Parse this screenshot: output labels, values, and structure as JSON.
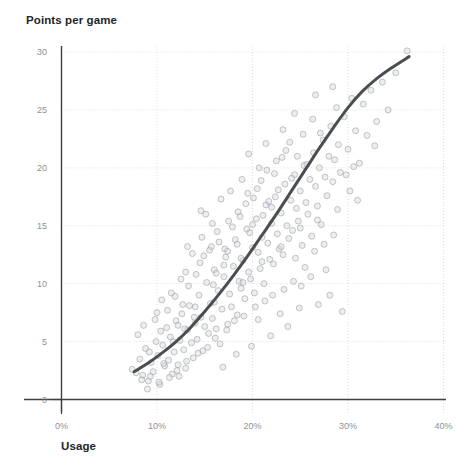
{
  "chart_data": {
    "type": "scatter",
    "title": "Points per game",
    "xlabel": "Usage",
    "ylabel": "",
    "grid": true,
    "grid_style": "dotted",
    "legend": "none",
    "xlim": [
      0,
      40
    ],
    "ylim": [
      0,
      30
    ],
    "x_tick_labels": [
      "0%",
      "10%",
      "20%",
      "30%",
      "40%"
    ],
    "x_ticks": [
      0,
      10,
      20,
      30,
      40
    ],
    "y_tick_labels": [
      "0",
      "5",
      "10",
      "15",
      "20",
      "25",
      "30"
    ],
    "y_ticks": [
      0,
      5,
      10,
      15,
      20,
      25,
      30
    ],
    "x_unit": "%",
    "marker": {
      "shape": "circle",
      "size_px": 6,
      "stroke_color": "#8a8f95",
      "fill_color": "#d8dade",
      "opacity": 0.55
    },
    "trend_line": {
      "name": "fitted curve",
      "color": "#4a4d52",
      "width_px": 3,
      "points": [
        [
          7.6,
          2.4
        ],
        [
          9.0,
          3.1
        ],
        [
          10.5,
          4.0
        ],
        [
          12.0,
          5.0
        ],
        [
          13.5,
          6.2
        ],
        [
          15.0,
          7.6
        ],
        [
          16.5,
          9.1
        ],
        [
          18.0,
          10.7
        ],
        [
          19.5,
          12.4
        ],
        [
          21.0,
          14.2
        ],
        [
          22.5,
          16.0
        ],
        [
          24.0,
          17.9
        ],
        [
          25.5,
          19.8
        ],
        [
          27.0,
          21.7
        ],
        [
          28.5,
          23.5
        ],
        [
          30.0,
          25.2
        ],
        [
          31.5,
          26.6
        ],
        [
          33.0,
          27.7
        ],
        [
          34.5,
          28.6
        ],
        [
          36.4,
          29.6
        ]
      ]
    },
    "points": [
      [
        7.4,
        2.6
      ],
      [
        7.8,
        2.3
      ],
      [
        8.2,
        3.5
      ],
      [
        8.5,
        2.1
      ],
      [
        8.8,
        4.4
      ],
      [
        9.1,
        1.6
      ],
      [
        9.4,
        3.2
      ],
      [
        9.6,
        2.4
      ],
      [
        9.9,
        5.0
      ],
      [
        10.1,
        3.8
      ],
      [
        10.3,
        1.3
      ],
      [
        10.6,
        4.7
      ],
      [
        10.8,
        2.9
      ],
      [
        11.0,
        6.2
      ],
      [
        11.2,
        3.4
      ],
      [
        11.4,
        5.4
      ],
      [
        11.6,
        2.2
      ],
      [
        11.8,
        4.1
      ],
      [
        12.0,
        6.8
      ],
      [
        12.2,
        3.0
      ],
      [
        12.4,
        5.1
      ],
      [
        12.6,
        7.4
      ],
      [
        12.8,
        4.3
      ],
      [
        13.0,
        2.7
      ],
      [
        13.2,
        6.0
      ],
      [
        13.4,
        8.1
      ],
      [
        13.6,
        4.9
      ],
      [
        13.8,
        3.6
      ],
      [
        14.0,
        6.6
      ],
      [
        14.2,
        5.2
      ],
      [
        14.4,
        9.0
      ],
      [
        14.6,
        7.1
      ],
      [
        14.8,
        4.2
      ],
      [
        15.0,
        6.3
      ],
      [
        15.2,
        10.1
      ],
      [
        15.4,
        5.7
      ],
      [
        15.6,
        8.3
      ],
      [
        15.8,
        7.0
      ],
      [
        16.0,
        11.2
      ],
      [
        16.2,
        6.1
      ],
      [
        16.4,
        9.4
      ],
      [
        16.6,
        4.8
      ],
      [
        16.8,
        7.8
      ],
      [
        17.0,
        10.6
      ],
      [
        17.2,
        12.3
      ],
      [
        17.4,
        6.5
      ],
      [
        17.6,
        9.1
      ],
      [
        17.8,
        8.0
      ],
      [
        18.0,
        11.5
      ],
      [
        18.2,
        13.8
      ],
      [
        18.4,
        7.3
      ],
      [
        18.6,
        10.2
      ],
      [
        18.8,
        9.6
      ],
      [
        19.0,
        12.0
      ],
      [
        19.2,
        8.7
      ],
      [
        19.4,
        14.7
      ],
      [
        19.6,
        11.0
      ],
      [
        19.8,
        10.4
      ],
      [
        20.0,
        13.1
      ],
      [
        20.2,
        9.2
      ],
      [
        20.4,
        15.6
      ],
      [
        20.6,
        12.7
      ],
      [
        20.8,
        11.3
      ],
      [
        21.0,
        14.0
      ],
      [
        21.2,
        10.0
      ],
      [
        21.4,
        16.8
      ],
      [
        21.6,
        13.5
      ],
      [
        21.8,
        12.1
      ],
      [
        22.0,
        15.2
      ],
      [
        22.2,
        11.7
      ],
      [
        22.4,
        17.5
      ],
      [
        22.6,
        14.3
      ],
      [
        22.8,
        13.0
      ],
      [
        23.0,
        16.1
      ],
      [
        23.2,
        12.5
      ],
      [
        23.4,
        18.6
      ],
      [
        23.6,
        15.0
      ],
      [
        23.8,
        13.9
      ],
      [
        24.0,
        17.2
      ],
      [
        24.2,
        14.6
      ],
      [
        24.4,
        19.4
      ],
      [
        24.6,
        16.5
      ],
      [
        24.8,
        15.4
      ],
      [
        25.0,
        18.0
      ],
      [
        25.2,
        13.3
      ],
      [
        25.4,
        20.2
      ],
      [
        25.6,
        17.0
      ],
      [
        25.8,
        16.0
      ],
      [
        26.0,
        19.0
      ],
      [
        26.2,
        14.1
      ],
      [
        26.4,
        21.3
      ],
      [
        26.6,
        18.4
      ],
      [
        26.8,
        16.7
      ],
      [
        27.0,
        20.0
      ],
      [
        27.2,
        15.1
      ],
      [
        27.4,
        22.4
      ],
      [
        27.6,
        19.2
      ],
      [
        27.8,
        17.6
      ],
      [
        28.0,
        21.0
      ],
      [
        28.2,
        23.6
      ],
      [
        28.4,
        18.8
      ],
      [
        28.6,
        20.7
      ],
      [
        28.8,
        25.2
      ],
      [
        29.0,
        22.0
      ],
      [
        29.2,
        19.6
      ],
      [
        29.6,
        24.4
      ],
      [
        30.0,
        21.6
      ],
      [
        30.4,
        26.0
      ],
      [
        30.8,
        23.2
      ],
      [
        31.2,
        20.4
      ],
      [
        31.6,
        25.5
      ],
      [
        32.0,
        22.8
      ],
      [
        32.4,
        26.7
      ],
      [
        33.0,
        24.0
      ],
      [
        33.6,
        27.4
      ],
      [
        34.2,
        25.0
      ],
      [
        35.0,
        28.2
      ],
      [
        36.2,
        30.1
      ],
      [
        10.0,
        7.5
      ],
      [
        10.5,
        8.6
      ],
      [
        11.5,
        9.2
      ],
      [
        12.5,
        10.4
      ],
      [
        13.0,
        11.0
      ],
      [
        14.5,
        11.8
      ],
      [
        15.5,
        12.9
      ],
      [
        16.5,
        13.6
      ],
      [
        17.5,
        15.4
      ],
      [
        18.5,
        16.2
      ],
      [
        19.5,
        17.8
      ],
      [
        20.5,
        18.2
      ],
      [
        21.5,
        19.8
      ],
      [
        22.5,
        20.6
      ],
      [
        23.5,
        21.5
      ],
      [
        24.5,
        12.2
      ],
      [
        25.5,
        11.4
      ],
      [
        26.5,
        12.8
      ],
      [
        27.5,
        13.4
      ],
      [
        28.5,
        14.2
      ],
      [
        8.0,
        5.6
      ],
      [
        8.6,
        6.4
      ],
      [
        9.2,
        4.1
      ],
      [
        9.8,
        6.9
      ],
      [
        10.4,
        5.9
      ],
      [
        11.1,
        7.7
      ],
      [
        11.9,
        8.9
      ],
      [
        12.7,
        8.2
      ],
      [
        13.3,
        9.8
      ],
      [
        14.1,
        10.8
      ],
      [
        14.9,
        12.4
      ],
      [
        15.7,
        13.2
      ],
      [
        16.3,
        14.5
      ],
      [
        17.1,
        13.0
      ],
      [
        17.9,
        14.9
      ],
      [
        18.7,
        15.8
      ],
      [
        19.3,
        16.9
      ],
      [
        20.1,
        17.4
      ],
      [
        20.9,
        18.9
      ],
      [
        21.7,
        17.1
      ],
      [
        22.3,
        19.5
      ],
      [
        23.1,
        20.9
      ],
      [
        23.9,
        22.2
      ],
      [
        24.7,
        21.0
      ],
      [
        25.3,
        22.9
      ],
      [
        12.1,
        2.5
      ],
      [
        13.1,
        3.3
      ],
      [
        14.3,
        4.0
      ],
      [
        15.3,
        4.5
      ],
      [
        16.1,
        5.3
      ],
      [
        17.3,
        6.0
      ],
      [
        18.1,
        6.8
      ],
      [
        19.1,
        7.2
      ],
      [
        20.3,
        8.0
      ],
      [
        21.3,
        8.5
      ],
      [
        22.1,
        9.0
      ],
      [
        23.3,
        9.5
      ],
      [
        24.3,
        10.2
      ],
      [
        25.1,
        9.8
      ],
      [
        26.1,
        10.6
      ],
      [
        9.0,
        0.9
      ],
      [
        10.2,
        1.5
      ],
      [
        11.3,
        1.9
      ],
      [
        12.3,
        2.0
      ],
      [
        16.9,
        2.8
      ],
      [
        18.3,
        3.9
      ],
      [
        19.9,
        4.6
      ],
      [
        21.9,
        5.5
      ],
      [
        23.7,
        6.3
      ],
      [
        26.9,
        8.2
      ],
      [
        28.1,
        9.0
      ],
      [
        29.4,
        7.6
      ],
      [
        15.1,
        16.0
      ],
      [
        16.7,
        17.3
      ],
      [
        14.7,
        14.0
      ],
      [
        13.7,
        12.6
      ],
      [
        18.9,
        19.0
      ],
      [
        17.7,
        18.0
      ],
      [
        20.7,
        20.0
      ],
      [
        19.7,
        14.4
      ],
      [
        21.1,
        15.9
      ],
      [
        22.7,
        18.1
      ],
      [
        24.1,
        19.1
      ],
      [
        25.7,
        20.3
      ],
      [
        27.1,
        23.0
      ],
      [
        26.3,
        24.2
      ],
      [
        29.8,
        19.4
      ],
      [
        30.6,
        20.1
      ],
      [
        12.9,
        6.1
      ],
      [
        11.7,
        5.0
      ],
      [
        10.7,
        3.1
      ],
      [
        9.3,
        2.0
      ],
      [
        8.4,
        1.7
      ],
      [
        20.6,
        6.9
      ],
      [
        22.9,
        7.4
      ],
      [
        24.9,
        7.9
      ],
      [
        27.7,
        11.2
      ],
      [
        14.0,
        8.0
      ],
      [
        15.9,
        9.9
      ],
      [
        17.0,
        11.6
      ],
      [
        18.8,
        12.2
      ],
      [
        19.0,
        10.1
      ],
      [
        16.0,
        8.4
      ],
      [
        13.9,
        7.1
      ],
      [
        12.2,
        6.4
      ],
      [
        21.0,
        11.9
      ],
      [
        23.0,
        13.2
      ],
      [
        25.0,
        14.8
      ],
      [
        26.8,
        15.5
      ],
      [
        28.9,
        16.4
      ],
      [
        31.0,
        17.2
      ],
      [
        30.2,
        18.0
      ],
      [
        16.2,
        10.9
      ],
      [
        17.4,
        12.8
      ],
      [
        18.4,
        13.4
      ],
      [
        20.0,
        15.1
      ],
      [
        22.0,
        16.6
      ],
      [
        14.6,
        16.3
      ],
      [
        15.8,
        15.2
      ],
      [
        13.2,
        13.2
      ],
      [
        19.6,
        21.2
      ],
      [
        21.4,
        22.1
      ],
      [
        23.2,
        23.3
      ],
      [
        26.6,
        26.3
      ],
      [
        24.4,
        24.7
      ],
      [
        28.4,
        27.0
      ],
      [
        32.8,
        21.9
      ]
    ]
  }
}
